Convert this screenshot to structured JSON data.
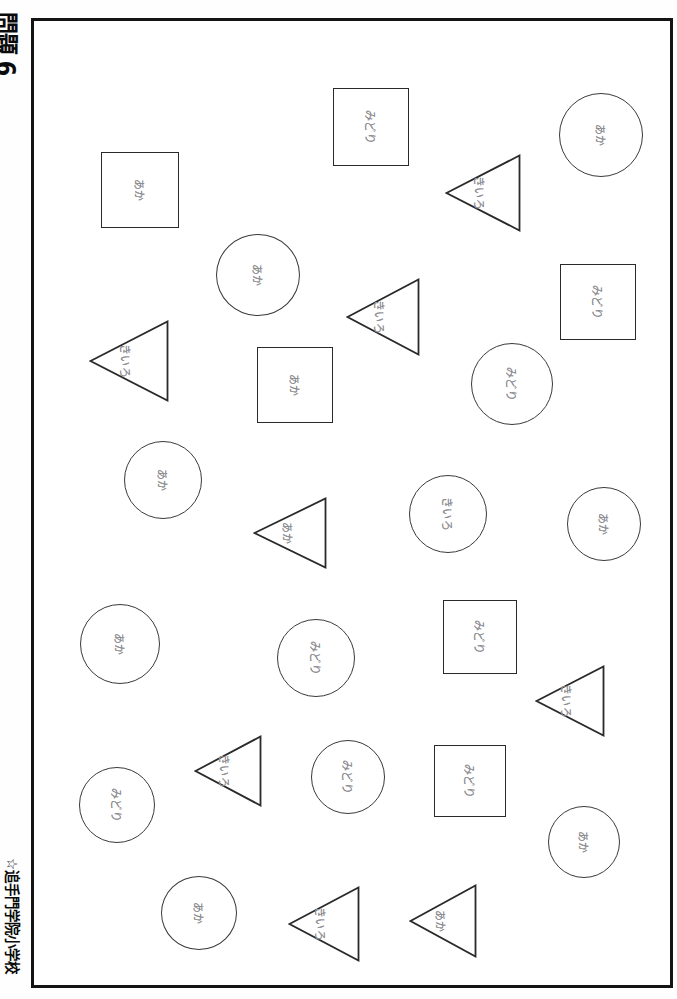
{
  "margins": {
    "question_number": "問題 6",
    "school_name": "☆追手門学院小学校"
  },
  "colors": {
    "frame": "#141414",
    "square_stroke": "#2a2a2a",
    "circle_stroke": "#3a3a3a",
    "triangle_stroke": "#2a2a2a",
    "label_text": "#8e8e93",
    "page_background": "#ffffff"
  },
  "legend": {
    "aka": "あか",
    "kiiro": "きいろ",
    "midori": "みどり"
  },
  "shapes": [
    {
      "id": 1,
      "type": "square",
      "label": "みどり",
      "x": 333,
      "y": 88,
      "w": 76,
      "h": 78
    },
    {
      "id": 2,
      "type": "circle",
      "label": "あか",
      "x": 559,
      "y": 93,
      "w": 84,
      "h": 84
    },
    {
      "id": 3,
      "type": "square",
      "label": "あか",
      "x": 101,
      "y": 152,
      "w": 78,
      "h": 76
    },
    {
      "id": 4,
      "type": "triangle",
      "label": "きいろ",
      "x": 445,
      "y": 154,
      "w": 76,
      "h": 78
    },
    {
      "id": 5,
      "type": "circle",
      "label": "あか",
      "x": 216,
      "y": 234,
      "w": 84,
      "h": 82
    },
    {
      "id": 6,
      "type": "square",
      "label": "みどり",
      "x": 560,
      "y": 264,
      "w": 76,
      "h": 76
    },
    {
      "id": 7,
      "type": "triangle",
      "label": "きいろ",
      "x": 346,
      "y": 278,
      "w": 74,
      "h": 78
    },
    {
      "id": 8,
      "type": "triangle",
      "label": "きいろ",
      "x": 89,
      "y": 320,
      "w": 80,
      "h": 82
    },
    {
      "id": 9,
      "type": "square",
      "label": "あか",
      "x": 257,
      "y": 347,
      "w": 76,
      "h": 76
    },
    {
      "id": 10,
      "type": "circle",
      "label": "みどり",
      "x": 471,
      "y": 343,
      "w": 82,
      "h": 82
    },
    {
      "id": 11,
      "type": "circle",
      "label": "あか",
      "x": 124,
      "y": 441,
      "w": 78,
      "h": 78
    },
    {
      "id": 12,
      "type": "triangle",
      "label": "あか",
      "x": 253,
      "y": 497,
      "w": 74,
      "h": 72
    },
    {
      "id": 13,
      "type": "circle",
      "label": "きいろ",
      "x": 409,
      "y": 475,
      "w": 78,
      "h": 78
    },
    {
      "id": 14,
      "type": "circle",
      "label": "あか",
      "x": 567,
      "y": 487,
      "w": 74,
      "h": 74
    },
    {
      "id": 15,
      "type": "circle",
      "label": "あか",
      "x": 80,
      "y": 604,
      "w": 80,
      "h": 80
    },
    {
      "id": 16,
      "type": "circle",
      "label": "みどり",
      "x": 277,
      "y": 619,
      "w": 78,
      "h": 78
    },
    {
      "id": 17,
      "type": "square",
      "label": "みどり",
      "x": 443,
      "y": 600,
      "w": 74,
      "h": 74
    },
    {
      "id": 18,
      "type": "triangle",
      "label": "きいろ",
      "x": 535,
      "y": 665,
      "w": 70,
      "h": 72
    },
    {
      "id": 19,
      "type": "circle",
      "label": "みどり",
      "x": 79,
      "y": 767,
      "w": 76,
      "h": 76
    },
    {
      "id": 20,
      "type": "triangle",
      "label": "きいろ",
      "x": 194,
      "y": 735,
      "w": 68,
      "h": 72
    },
    {
      "id": 21,
      "type": "circle",
      "label": "みどり",
      "x": 311,
      "y": 740,
      "w": 74,
      "h": 74
    },
    {
      "id": 22,
      "type": "square",
      "label": "みどり",
      "x": 434,
      "y": 745,
      "w": 72,
      "h": 72
    },
    {
      "id": 23,
      "type": "circle",
      "label": "あか",
      "x": 548,
      "y": 806,
      "w": 72,
      "h": 72
    },
    {
      "id": 24,
      "type": "circle",
      "label": "あか",
      "x": 161,
      "y": 876,
      "w": 76,
      "h": 74
    },
    {
      "id": 25,
      "type": "triangle",
      "label": "きいろ",
      "x": 288,
      "y": 886,
      "w": 72,
      "h": 76
    },
    {
      "id": 26,
      "type": "triangle",
      "label": "あか",
      "x": 409,
      "y": 884,
      "w": 68,
      "h": 74
    }
  ]
}
